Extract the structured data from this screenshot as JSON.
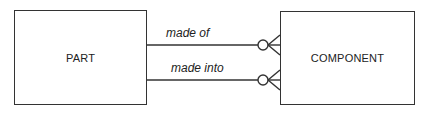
{
  "diagram": {
    "type": "entity-relationship",
    "entities": [
      {
        "id": "part",
        "label": "PART"
      },
      {
        "id": "component",
        "label": "COMPONENT"
      }
    ],
    "relationships": [
      {
        "label": "made of",
        "from": "PART",
        "to": "COMPONENT",
        "to_cardinality": "zero-or-many"
      },
      {
        "label": "made into",
        "from": "PART",
        "to": "COMPONENT",
        "to_cardinality": "zero-or-many"
      }
    ]
  }
}
